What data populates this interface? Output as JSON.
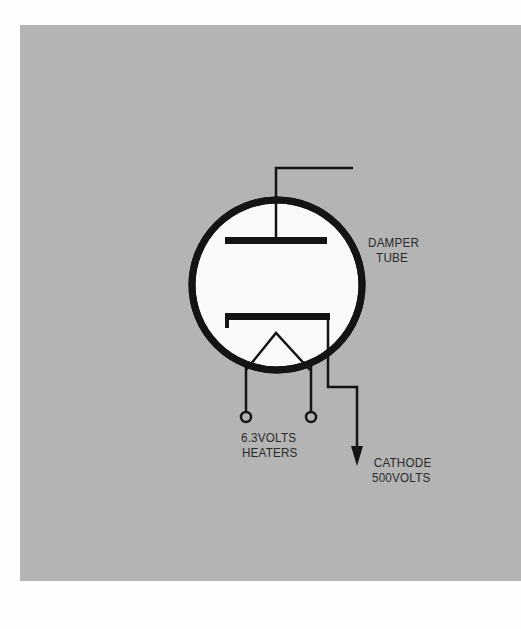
{
  "diagram": {
    "tube_label": {
      "line1": "DAMPER",
      "line2": "TUBE"
    },
    "heater_label": {
      "line1": "6.3VOLTS",
      "line2": "HEATERS"
    },
    "cathode_label": {
      "line1": "CATHODE",
      "line2": "500VOLTS"
    },
    "colors": {
      "background": "#fdfdfd",
      "panel": "#b4b4b4",
      "tube_envelope_fill": "#fafafa",
      "ink": "#141414"
    },
    "components": [
      {
        "name": "plate",
        "connection": "top lead to upper right"
      },
      {
        "name": "cathode",
        "connection": "right lead down to arrow (500 volts)"
      },
      {
        "name": "heater",
        "connection": "two terminals (6.3 volts)"
      }
    ]
  }
}
